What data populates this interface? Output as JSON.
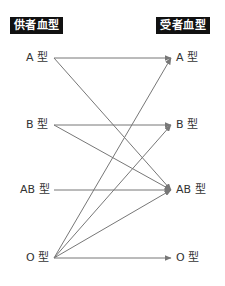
{
  "headers": {
    "donor": "供者血型",
    "recipient": "受者血型"
  },
  "donors": [
    {
      "id": "A",
      "label": "A 型",
      "y": 58
    },
    {
      "id": "B",
      "label": "B 型",
      "y": 125
    },
    {
      "id": "AB",
      "label": "AB 型",
      "y": 190
    },
    {
      "id": "O",
      "label": "O 型",
      "y": 258
    }
  ],
  "recipients": [
    {
      "id": "A",
      "label": "A 型",
      "y": 58
    },
    {
      "id": "B",
      "label": "B 型",
      "y": 125
    },
    {
      "id": "AB",
      "label": "AB 型",
      "y": 190
    },
    {
      "id": "O",
      "label": "O 型",
      "y": 258
    }
  ],
  "edges": [
    {
      "from": "A",
      "to": "A"
    },
    {
      "from": "A",
      "to": "AB"
    },
    {
      "from": "B",
      "to": "B"
    },
    {
      "from": "B",
      "to": "AB"
    },
    {
      "from": "AB",
      "to": "AB"
    },
    {
      "from": "O",
      "to": "A"
    },
    {
      "from": "O",
      "to": "B"
    },
    {
      "from": "O",
      "to": "AB"
    },
    {
      "from": "O",
      "to": "O"
    }
  ],
  "colors": {
    "line": "#777777",
    "header_bg": "#111111",
    "header_text": "#ffffff",
    "label_text": "#333333"
  }
}
